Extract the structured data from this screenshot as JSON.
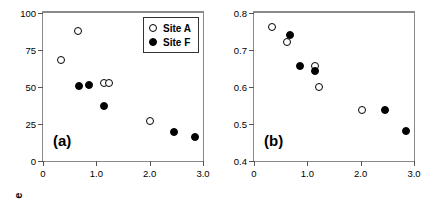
{
  "figure": {
    "panels": [
      "a",
      "b"
    ]
  },
  "legend": {
    "position": "top-right-panel-a",
    "entries": [
      {
        "marker": "open-circle-icon",
        "label": "Site A"
      },
      {
        "marker": "filled-circle-icon",
        "label": "Site F"
      }
    ]
  },
  "chart_data": [
    {
      "type": "scatter",
      "title": "",
      "panel_label": "(a)",
      "xlabel": "",
      "ylabel": "Eggs laid per female",
      "xlim": [
        0,
        3.0
      ],
      "ylim": [
        0,
        100
      ],
      "xticks": [
        0,
        1.0,
        2.0,
        3.0
      ],
      "xtick_labels": [
        "0",
        "1.0",
        "2.0",
        "3.0"
      ],
      "yticks": [
        0,
        25,
        50,
        75,
        100
      ],
      "ytick_labels": [
        "0",
        "25",
        "50",
        "75",
        "100"
      ],
      "grid": false,
      "legend_position": "upper right",
      "series": [
        {
          "name": "Site A",
          "marker": "open-circle",
          "points": [
            {
              "x": 0.34,
              "y": 68
            },
            {
              "x": 0.66,
              "y": 88
            },
            {
              "x": 1.15,
              "y": 53
            },
            {
              "x": 1.23,
              "y": 53
            },
            {
              "x": 2.0,
              "y": 27
            }
          ]
        },
        {
          "name": "Site F",
          "marker": "filled-circle",
          "points": [
            {
              "x": 0.67,
              "y": 51
            },
            {
              "x": 0.86,
              "y": 51.5
            },
            {
              "x": 1.15,
              "y": 37
            },
            {
              "x": 2.45,
              "y": 19.5
            },
            {
              "x": 2.85,
              "y": 16
            }
          ]
        }
      ]
    },
    {
      "type": "scatter",
      "title": "",
      "panel_label": "(b)",
      "xlabel": "",
      "ylabel": "Female survival",
      "xlim": [
        0,
        3.0
      ],
      "ylim": [
        0.4,
        0.8
      ],
      "xticks": [
        0,
        1.0,
        2.0,
        3.0
      ],
      "xtick_labels": [
        "0",
        "1.0",
        "2.0",
        "3.0"
      ],
      "yticks": [
        0.4,
        0.5,
        0.6,
        0.7,
        0.8
      ],
      "ytick_labels": [
        "0.4",
        "0.5",
        "0.6",
        "0.7",
        "0.8"
      ],
      "grid": false,
      "legend_position": "none",
      "series": [
        {
          "name": "Site A",
          "marker": "open-circle",
          "points": [
            {
              "x": 0.33,
              "y": 0.762
            },
            {
              "x": 0.62,
              "y": 0.722
            },
            {
              "x": 1.15,
              "y": 0.657
            },
            {
              "x": 1.22,
              "y": 0.6
            },
            {
              "x": 2.02,
              "y": 0.538
            }
          ]
        },
        {
          "name": "Site F",
          "marker": "filled-circle",
          "points": [
            {
              "x": 0.68,
              "y": 0.74
            },
            {
              "x": 0.86,
              "y": 0.657
            },
            {
              "x": 1.15,
              "y": 0.643
            },
            {
              "x": 2.45,
              "y": 0.538
            },
            {
              "x": 2.85,
              "y": 0.48
            }
          ]
        }
      ]
    }
  ]
}
